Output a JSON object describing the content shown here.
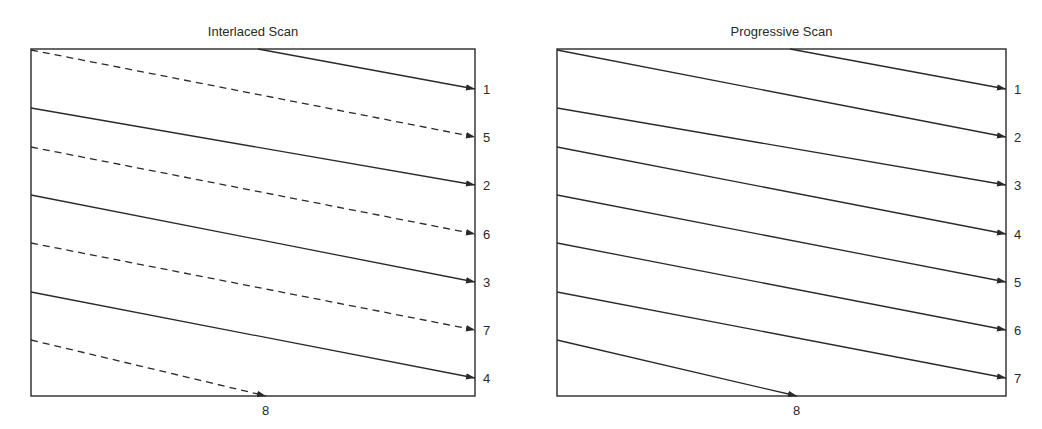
{
  "panels": [
    {
      "title": "Interlaced Scan",
      "box": {
        "x1": 31,
        "y1": 49,
        "x2": 475,
        "y2": 396
      },
      "lines": [
        {
          "label": "1",
          "style": "solid",
          "x0": 258,
          "y0": 49,
          "y1": 89
        },
        {
          "label": "5",
          "style": "dashed",
          "x0": 31,
          "y0": 50,
          "y1": 137
        },
        {
          "label": "2",
          "style": "solid",
          "x0": 31,
          "y0": 108,
          "y1": 185
        },
        {
          "label": "6",
          "style": "dashed",
          "x0": 31,
          "y0": 147,
          "y1": 234
        },
        {
          "label": "3",
          "style": "solid",
          "x0": 31,
          "y0": 195,
          "y1": 282
        },
        {
          "label": "7",
          "style": "dashed",
          "x0": 31,
          "y0": 243,
          "y1": 330
        },
        {
          "label": "4",
          "style": "solid",
          "x0": 31,
          "y0": 292,
          "y1": 378
        }
      ],
      "last_line": {
        "label": "8",
        "style": "dashed",
        "x0": 31,
        "y0": 340,
        "x1": 266,
        "y1": 396
      }
    },
    {
      "title": "Progressive Scan",
      "box": {
        "x1": 557,
        "y1": 49,
        "x2": 1006,
        "y2": 396
      },
      "lines": [
        {
          "label": "1",
          "style": "solid",
          "x0": 790,
          "y0": 49,
          "y1": 89
        },
        {
          "label": "2",
          "style": "solid",
          "x0": 557,
          "y0": 50,
          "y1": 137
        },
        {
          "label": "3",
          "style": "solid",
          "x0": 557,
          "y0": 108,
          "y1": 185
        },
        {
          "label": "4",
          "style": "solid",
          "x0": 557,
          "y0": 147,
          "y1": 234
        },
        {
          "label": "5",
          "style": "solid",
          "x0": 557,
          "y0": 195,
          "y1": 282
        },
        {
          "label": "6",
          "style": "solid",
          "x0": 557,
          "y0": 243,
          "y1": 330
        },
        {
          "label": "7",
          "style": "solid",
          "x0": 557,
          "y0": 292,
          "y1": 378
        }
      ],
      "last_line": {
        "label": "8",
        "style": "solid",
        "x0": 557,
        "y0": 340,
        "x1": 797,
        "y1": 396
      }
    }
  ],
  "colors": {
    "stroke": "#2a2a2a",
    "background": "#ffffff"
  }
}
